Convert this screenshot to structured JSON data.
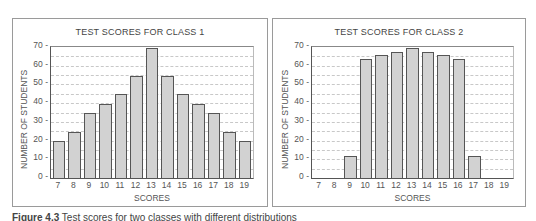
{
  "chart_data": [
    {
      "type": "bar",
      "title": "TEST SCORES FOR CLASS 1",
      "xlabel": "SCORES",
      "ylabel": "NUMBER OF STUDENTS",
      "categories": [
        "7",
        "8",
        "9",
        "10",
        "11",
        "12",
        "13",
        "14",
        "15",
        "16",
        "17",
        "18",
        "19"
      ],
      "values": [
        20,
        25,
        35,
        40,
        45,
        55,
        70,
        55,
        45,
        40,
        35,
        25,
        20
      ],
      "yticks": [
        "0",
        "10",
        "20",
        "30",
        "40",
        "50",
        "60",
        "70"
      ],
      "ylim": [
        0,
        70
      ],
      "grid": true
    },
    {
      "type": "bar",
      "title": "TEST SCORES FOR CLASS 2",
      "xlabel": "SCORES",
      "ylabel": "NUMBER OF STUDENTS",
      "categories": [
        "7",
        "8",
        "9",
        "10",
        "11",
        "12",
        "13",
        "14",
        "15",
        "16",
        "17",
        "18",
        "19"
      ],
      "values": [
        0,
        0,
        12,
        64,
        66,
        68,
        70,
        68,
        66,
        64,
        12,
        0,
        0
      ],
      "yticks": [
        "0",
        "10",
        "20",
        "30",
        "40",
        "50",
        "60",
        "70"
      ],
      "ylim": [
        0,
        70
      ],
      "grid": true
    }
  ],
  "caption": {
    "label": "Figure 4.3",
    "text": "Test scores for two classes with different distributions"
  }
}
